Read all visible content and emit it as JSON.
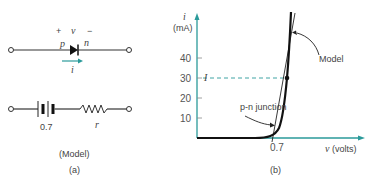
{
  "panel_a": {
    "polarity_plus": "+",
    "voltage_symbol": "v",
    "polarity_minus": "−",
    "p_label": "p",
    "n_label": "n",
    "current_symbol": "i",
    "battery_value": "0.7",
    "resistor_label": "r",
    "model_caption": "(Model)",
    "caption": "(a)"
  },
  "panel_b": {
    "y_axis_symbol": "i",
    "y_axis_unit": "(mA)",
    "y_ticks": [
      "10",
      "20",
      "30",
      "40"
    ],
    "current_marker": "I",
    "x_tick": "0.7",
    "x_axis_label": "v (volts)",
    "model_label": "Model",
    "junction_label": "p-n junction",
    "caption": "(b)",
    "colors": {
      "axis": "#2a9a9a",
      "curve": "#1a1a1a"
    }
  },
  "chart_data": {
    "type": "line",
    "title": "",
    "xlabel": "v (volts)",
    "ylabel": "i (mA)",
    "ylim": [
      0,
      50
    ],
    "y_ticks": [
      10,
      20,
      30,
      40
    ],
    "x_ticks": [
      0.7
    ],
    "series": [
      {
        "name": "p-n junction",
        "style": "exponential curve",
        "points": [
          [
            0.0,
            0
          ],
          [
            0.5,
            0
          ],
          [
            0.6,
            1
          ],
          [
            0.7,
            5
          ],
          [
            0.75,
            15
          ],
          [
            0.78,
            30
          ],
          [
            0.8,
            50
          ]
        ]
      },
      {
        "name": "Model",
        "style": "straight line",
        "points": [
          [
            0.7,
            0
          ],
          [
            0.8,
            50
          ]
        ]
      }
    ],
    "annotations": [
      {
        "text": "I",
        "y": 30,
        "note": "dashed line to operating point"
      },
      {
        "text": "Model"
      },
      {
        "text": "p-n junction"
      }
    ]
  }
}
